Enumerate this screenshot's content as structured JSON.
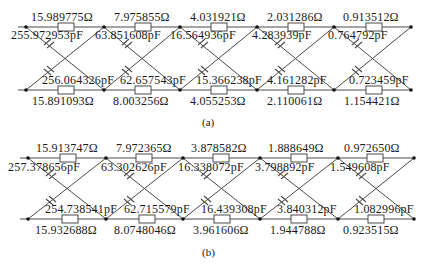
{
  "circuits": [
    {
      "caption": "(a)",
      "top_resistors": [
        "15.989775Ω",
        "7.975855Ω",
        "4.031921Ω",
        "2.031286Ω",
        "0.913512Ω"
      ],
      "top_capacitors": [
        "255.972953pF",
        "63.851608pF",
        "16.564936pF",
        "4.283939pF",
        "0.764792pF"
      ],
      "bottom_capacitors": [
        "256.064326pF",
        "62.657543pF",
        "15.366238pF",
        "4.161282pF",
        "0.723459pF"
      ],
      "bottom_resistors": [
        "15.891093Ω",
        "8.003256Ω",
        "4.055253Ω",
        "2.110061Ω",
        "1.154421Ω"
      ]
    },
    {
      "caption": "(b)",
      "top_resistors": [
        "15.913747Ω",
        "7.972365Ω",
        "3.878582Ω",
        "1.888649Ω",
        "0.972650Ω"
      ],
      "top_capacitors": [
        "257.378656pF",
        "63.302626pF",
        "16.338072pF",
        "3.798892pF",
        "1.549608pF"
      ],
      "bottom_capacitors": [
        "254.738541pF",
        "62.715579pF",
        "16.439308pF",
        "3.840312pF",
        "1.082996pF"
      ],
      "bottom_resistors": [
        "15.932688Ω",
        "8.0748046Ω",
        "3.961606Ω",
        "1.944788Ω",
        "0.923515Ω"
      ]
    }
  ],
  "style": {
    "line_color": "#4a4a4a",
    "node_color": "#111111"
  }
}
